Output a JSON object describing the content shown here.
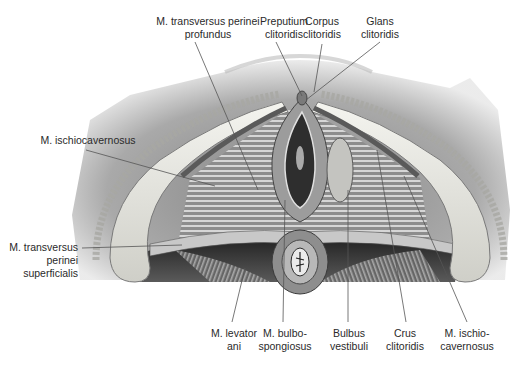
{
  "figure": {
    "colors": {
      "background": "#ffffff",
      "label_text": "#2a2a2a",
      "leader_line": "#555555",
      "skin_gray": "#8a8a8a",
      "muscle_light": "#d9d9d9",
      "muscle_dark": "#3a3a3a",
      "fat_pale": "#efefe8"
    }
  },
  "labels": {
    "top": [
      {
        "id": "transversus-profundus",
        "lines": [
          "M. transversus perinei",
          "profundus"
        ]
      },
      {
        "id": "preputium",
        "lines": [
          "Preputium",
          "clitoridis"
        ]
      },
      {
        "id": "corpus",
        "lines": [
          "Corpus",
          "clitoridis"
        ]
      },
      {
        "id": "glans",
        "lines": [
          "Glans",
          "clitoridis"
        ]
      }
    ],
    "left": [
      {
        "id": "ischiocavernosus-left",
        "lines": [
          "M. ischiocavernosus"
        ]
      },
      {
        "id": "transversus-superficialis",
        "lines": [
          "M. transversus",
          "perinei",
          "superficialis"
        ]
      }
    ],
    "bottom": [
      {
        "id": "levator-ani",
        "lines": [
          "M. levator",
          "ani"
        ]
      },
      {
        "id": "bulbospongiosus",
        "lines": [
          "M. bulbo-",
          "spongiosus"
        ]
      },
      {
        "id": "bulbus-vestibuli",
        "lines": [
          "Bulbus",
          "vestibuli"
        ]
      },
      {
        "id": "crus",
        "lines": [
          "Crus",
          "clitoridis"
        ]
      },
      {
        "id": "ischiocavernosus-right",
        "lines": [
          "M. ischio-",
          "cavernosus"
        ]
      }
    ]
  }
}
